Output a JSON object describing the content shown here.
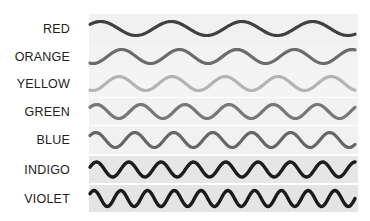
{
  "diagram": {
    "title": "",
    "rows": [
      {
        "label": "RED",
        "stroke": "#404040",
        "band": "#f1f1f1",
        "top": 14,
        "height": 29,
        "peaks": 3.75,
        "phase": 0.85,
        "amp": 7.0,
        "width": 3.2
      },
      {
        "label": "ORANGE",
        "stroke": "#6b6b6b",
        "band": "#f3f3f3",
        "top": 43,
        "height": 27,
        "peaks": 4.6,
        "phase": 0.45,
        "amp": 7.0,
        "width": 3.2
      },
      {
        "label": "YELLOW",
        "stroke": "#b4b4b4",
        "band": "#f4f4f4",
        "top": 70,
        "height": 27,
        "peaks": 5.0,
        "phase": 0.45,
        "amp": 7.0,
        "width": 3.2
      },
      {
        "label": "GREEN",
        "stroke": "#777777",
        "band": "#f2f2f2",
        "top": 98,
        "height": 27,
        "peaks": 6.0,
        "phase": 0.85,
        "amp": 7.0,
        "width": 3.2
      },
      {
        "label": "BLUE",
        "stroke": "#666666",
        "band": "#f1f1f1",
        "top": 126,
        "height": 28,
        "peaks": 6.8,
        "phase": 0.85,
        "amp": 7.5,
        "width": 3.2
      },
      {
        "label": "INDIGO",
        "stroke": "#1c1c1c",
        "band": "#e6e6e6",
        "top": 156,
        "height": 27,
        "peaks": 8.2,
        "phase": 0.8,
        "amp": 7.5,
        "width": 3.4
      },
      {
        "label": "VIOLET",
        "stroke": "#1a1a1a",
        "band": "#e4e4e4",
        "top": 185,
        "height": 27,
        "peaks": 9.9,
        "phase": 0.85,
        "amp": 8.0,
        "width": 3.4
      }
    ]
  }
}
